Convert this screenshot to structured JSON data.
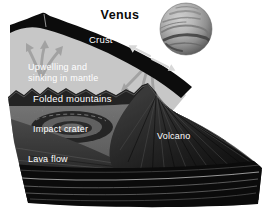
{
  "diagram": {
    "title": "Venus",
    "labels": {
      "crust": "Crust",
      "upwelling_line1": "Upwelling and",
      "upwelling_line2": "sinking in mantle",
      "folded_mountains": "Folded mountains",
      "impact_crater": "Impact crater",
      "volcano": "Volcano",
      "lava_flow": "Lava flow"
    },
    "icons": {
      "globe": "venus-planet-globe",
      "upwelling_arrow": "branching-arrow-up",
      "sinking_arrow": "branching-arrow-down",
      "crust_arrows": "diverging-spread-arrows"
    },
    "colors": {
      "background": "#ffffff",
      "crust": "#0c0c0c",
      "mantle": "#c7c7c7",
      "mantle_arrow": "#a2a2a2",
      "crust_arrow": "#d8d8d8",
      "label_text": "#ffffff",
      "title_text": "#0a0a0a"
    }
  }
}
